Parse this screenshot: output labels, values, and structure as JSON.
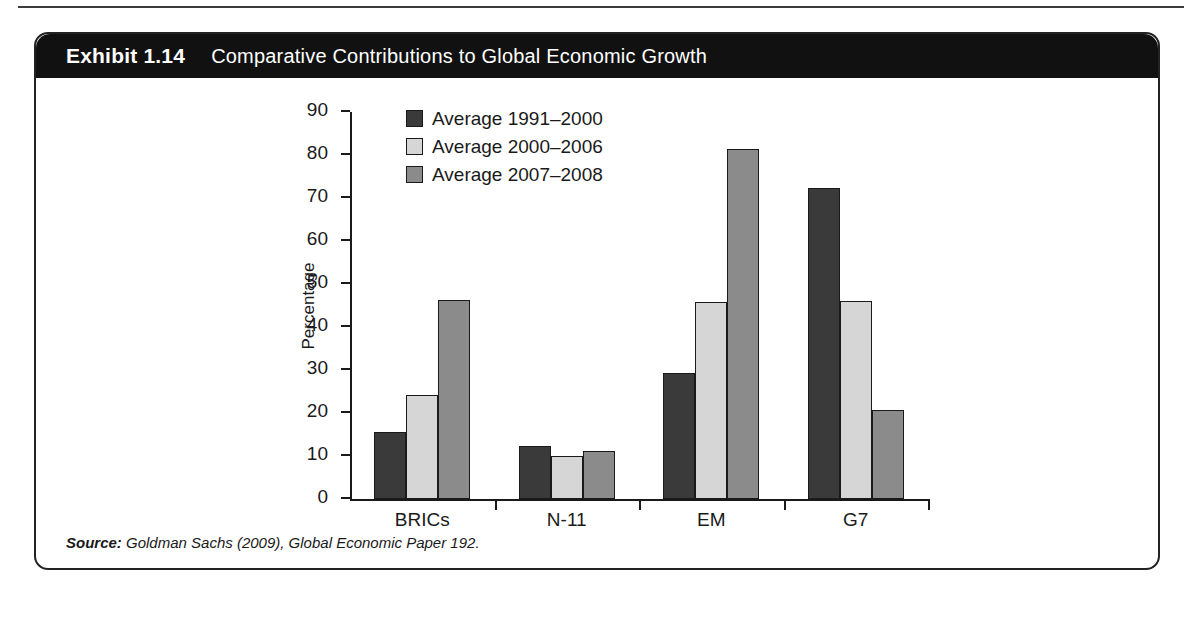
{
  "exhibit": {
    "label": "Exhibit 1.14",
    "title": "Comparative Contributions to Global Economic Growth",
    "source_label": "Source:",
    "source_text": "Goldman Sachs (2009), Global Economic Paper 192."
  },
  "chart_data": {
    "type": "bar",
    "title": "Comparative Contributions to Global Economic Growth",
    "xlabel": "",
    "ylabel": "Percentage",
    "ylim": [
      0,
      90
    ],
    "yticks": [
      0,
      10,
      20,
      30,
      40,
      50,
      60,
      70,
      80,
      90
    ],
    "ytick_labels": [
      "0",
      "10",
      "20",
      "30",
      "40",
      "50",
      "60",
      "70",
      "80",
      "90"
    ],
    "grid": false,
    "legend_position": "upper-left-inside",
    "categories": [
      "BRICs",
      "N-11",
      "EM",
      "G7"
    ],
    "series": [
      {
        "name": "Average 1991–2000",
        "color": "#3a3a3a",
        "values": [
          15.6,
          12.3,
          29.4,
          72.4
        ]
      },
      {
        "name": "Average 2000–2006",
        "color": "#d6d6d6",
        "values": [
          24.2,
          10.0,
          45.8,
          46.1
        ]
      },
      {
        "name": "Average 2007–2008",
        "color": "#8b8b8b",
        "values": [
          46.2,
          11.2,
          81.3,
          20.8
        ]
      }
    ]
  }
}
